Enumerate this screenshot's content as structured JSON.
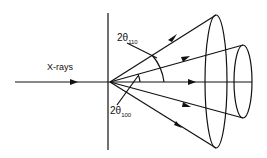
{
  "diagram": {
    "beam_label": "X-rays",
    "angle_110": {
      "prefix": "2θ",
      "sub": "110"
    },
    "angle_100": {
      "prefix": "2θ",
      "sub": "100"
    },
    "line_color": "#111111"
  }
}
